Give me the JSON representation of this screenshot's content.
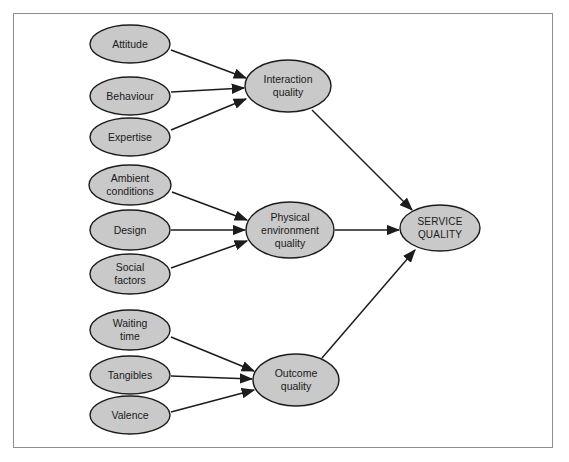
{
  "figure": {
    "background_color": "#ffffff",
    "frame_color": "#8d8d8d",
    "node_fill": "#c9c9c9",
    "node_stroke": "#1c1c1c",
    "edge_color": "#1c1c1c",
    "label_color": "#1a1a1a",
    "caption": ""
  },
  "nodes": {
    "attitude": {
      "label": "Attitude",
      "cx": 130,
      "cy": 44,
      "rx": 40,
      "ry": 19
    },
    "behaviour": {
      "label": "Behaviour",
      "cx": 130,
      "cy": 96,
      "rx": 40,
      "ry": 19
    },
    "expertise": {
      "label": "Expertise",
      "cx": 130,
      "cy": 137,
      "rx": 40,
      "ry": 19
    },
    "ambient_conditions": {
      "label_line1": "Ambient",
      "label_line2": "conditions",
      "cx": 130,
      "cy": 185,
      "rx": 41,
      "ry": 20
    },
    "design": {
      "label": "Design",
      "cx": 130,
      "cy": 230,
      "rx": 40,
      "ry": 20
    },
    "social_factors": {
      "label_line1": "Social",
      "label_line2": "factors",
      "cx": 130,
      "cy": 274,
      "rx": 40,
      "ry": 20
    },
    "waiting_time": {
      "label_line1": "Waiting",
      "label_line2": "time",
      "cx": 130,
      "cy": 330,
      "rx": 40,
      "ry": 20
    },
    "tangibles": {
      "label": "Tangibles",
      "cx": 130,
      "cy": 375,
      "rx": 40,
      "ry": 19
    },
    "valence": {
      "label": "Valence",
      "cx": 130,
      "cy": 415,
      "rx": 40,
      "ry": 19
    },
    "interaction_quality": {
      "label_line1": "Interaction",
      "label_line2": "quality",
      "cx": 288,
      "cy": 86,
      "rx": 43,
      "ry": 26
    },
    "physical_environment_quality": {
      "label_line1": "Physical",
      "label_line2": "environment",
      "label_line3": "quality",
      "cx": 290,
      "cy": 230,
      "rx": 44,
      "ry": 28
    },
    "outcome_quality": {
      "label_line1": "Outcome",
      "label_line2": "quality",
      "cx": 296,
      "cy": 380,
      "rx": 43,
      "ry": 26
    },
    "service_quality": {
      "label_line1": "SERVICE",
      "label_line2": "QUALITY",
      "cx": 440,
      "cy": 228,
      "rx": 40,
      "ry": 23
    }
  },
  "edges": [
    {
      "name": "attitude-to-interaction-quality",
      "from": "attitude",
      "to": "interaction_quality",
      "x1": 171,
      "y1": 50,
      "x2": 246,
      "y2": 78
    },
    {
      "name": "behaviour-to-interaction-quality",
      "from": "behaviour",
      "to": "interaction_quality",
      "x1": 171,
      "y1": 92,
      "x2": 244,
      "y2": 88
    },
    {
      "name": "expertise-to-interaction-quality",
      "from": "expertise",
      "to": "interaction_quality",
      "x1": 171,
      "y1": 130,
      "x2": 246,
      "y2": 99
    },
    {
      "name": "ambient-conditions-to-physical-environment-quality",
      "from": "ambient_conditions",
      "to": "physical_environment_quality",
      "x1": 172,
      "y1": 192,
      "x2": 247,
      "y2": 220
    },
    {
      "name": "design-to-physical-environment-quality",
      "from": "design",
      "to": "physical_environment_quality",
      "x1": 171,
      "y1": 230,
      "x2": 245,
      "y2": 230
    },
    {
      "name": "social-factors-to-physical-environment-quality",
      "from": "social_factors",
      "to": "physical_environment_quality",
      "x1": 171,
      "y1": 268,
      "x2": 247,
      "y2": 241
    },
    {
      "name": "waiting-time-to-outcome-quality",
      "from": "waiting_time",
      "to": "outcome_quality",
      "x1": 171,
      "y1": 337,
      "x2": 254,
      "y2": 371
    },
    {
      "name": "tangibles-to-outcome-quality",
      "from": "tangibles",
      "to": "outcome_quality",
      "x1": 171,
      "y1": 376,
      "x2": 252,
      "y2": 379
    },
    {
      "name": "valence-to-outcome-quality",
      "from": "valence",
      "to": "outcome_quality",
      "x1": 171,
      "y1": 412,
      "x2": 254,
      "y2": 390
    },
    {
      "name": "interaction-quality-to-service-quality",
      "from": "interaction_quality",
      "to": "service_quality",
      "x1": 312,
      "y1": 110,
      "x2": 412,
      "y2": 210
    },
    {
      "name": "physical-environment-quality-to-service-quality",
      "from": "physical_environment_quality",
      "to": "service_quality",
      "x1": 335,
      "y1": 230,
      "x2": 399,
      "y2": 230
    },
    {
      "name": "outcome-quality-to-service-quality",
      "from": "outcome_quality",
      "to": "service_quality",
      "x1": 322,
      "y1": 358,
      "x2": 415,
      "y2": 250
    }
  ]
}
